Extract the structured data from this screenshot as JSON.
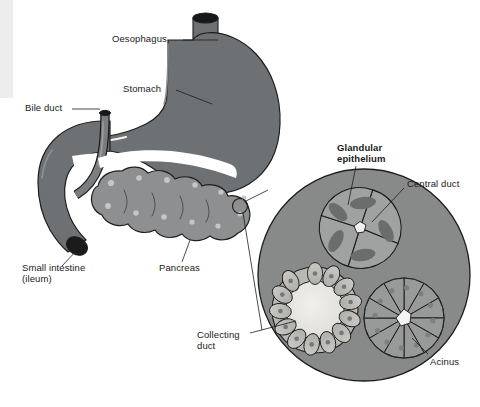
{
  "figure": {
    "background_color": "#ffffff",
    "organ_fill": "#6e7173",
    "pancreas_fill": "#8d8f90",
    "inset_fill": "#888a8a",
    "lumen_fill": "#e9e8e4",
    "outline_color": "#1d1d1d",
    "label_color": "#1a1a1a"
  },
  "labels": {
    "oesophagus": "Oesophagus",
    "stomach": "Stomach",
    "bile_duct": "Bile duct",
    "small_intestine_line1": "Small intestine",
    "small_intestine_line2": "(ileum)",
    "pancreas": "Pancreas",
    "glandular_line1": "Glandular",
    "glandular_line2": "epithelium",
    "central_duct": "Central duct",
    "collecting_line1": "Collecting",
    "collecting_line2": "duct",
    "acinus": "Acinus"
  },
  "inset": {
    "name": "pancreas-histology-inset",
    "center_x": 364,
    "center_y": 275,
    "radius": 106,
    "structures": [
      {
        "name": "glandular-epithelium",
        "cells": 5,
        "center_x": 360,
        "center_y": 228,
        "radius": 40
      },
      {
        "name": "collecting-duct",
        "cells": 13,
        "center_x": 315,
        "center_y": 310,
        "radius": 43
      },
      {
        "name": "acinus",
        "cells": 12,
        "center_x": 404,
        "center_y": 318,
        "radius": 40
      }
    ]
  }
}
